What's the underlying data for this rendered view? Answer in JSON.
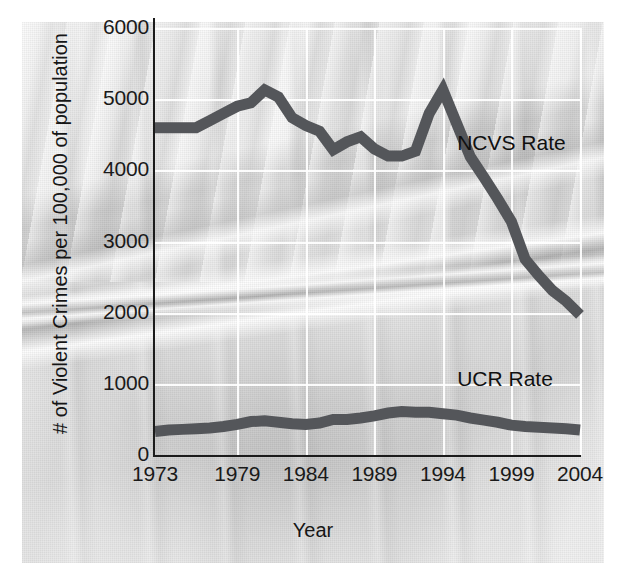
{
  "chart_data": {
    "type": "line",
    "title": "",
    "xlabel": "Year",
    "ylabel": "# of Violent Crimes per 100,000 of population",
    "xlim": [
      1973,
      2004
    ],
    "ylim": [
      0,
      6000
    ],
    "grid": true,
    "legend_position": "inline-right",
    "x_ticks": [
      "1973",
      "1979",
      "1984",
      "1989",
      "1994",
      "1999",
      "2004"
    ],
    "x_tick_values": [
      1973,
      1979,
      1984,
      1989,
      1994,
      1999,
      2004
    ],
    "y_ticks": [
      "0",
      "1000",
      "2000",
      "3000",
      "4000",
      "5000",
      "6000"
    ],
    "y_tick_values": [
      0,
      1000,
      2000,
      3000,
      4000,
      5000,
      6000
    ],
    "x": [
      1973,
      1974,
      1975,
      1976,
      1977,
      1978,
      1979,
      1980,
      1981,
      1982,
      1983,
      1984,
      1985,
      1986,
      1987,
      1988,
      1989,
      1990,
      1991,
      1992,
      1993,
      1994,
      1995,
      1996,
      1997,
      1998,
      1999,
      2000,
      2001,
      2002,
      2003,
      2004
    ],
    "series": [
      {
        "name": "NCVS Rate",
        "color": "#54565a",
        "values": [
          4600,
          4600,
          4600,
          4600,
          4700,
          4800,
          4900,
          4950,
          5130,
          5030,
          4740,
          4630,
          4550,
          4290,
          4400,
          4470,
          4300,
          4200,
          4200,
          4270,
          4800,
          5130,
          4660,
          4190,
          3900,
          3600,
          3280,
          2750,
          2520,
          2310,
          2160,
          1970
        ]
      },
      {
        "name": "UCR Rate",
        "color": "#54565a",
        "values": [
          330,
          350,
          360,
          370,
          380,
          400,
          430,
          470,
          480,
          460,
          440,
          430,
          450,
          500,
          500,
          520,
          550,
          590,
          610,
          600,
          600,
          580,
          560,
          520,
          490,
          460,
          420,
          400,
          390,
          380,
          370,
          350
        ]
      }
    ],
    "annotations": [
      {
        "text": "NCVS Rate",
        "x": 1996.5,
        "y": 4350
      },
      {
        "text": "UCR Rate",
        "x": 1996.5,
        "y": 1040
      }
    ]
  },
  "axis": {
    "y_label": "# of Violent Crimes per 100,000 of population",
    "x_label": "Year",
    "y_ticks": [
      "6000",
      "5000",
      "4000",
      "3000",
      "2000",
      "1000",
      "0"
    ],
    "x_ticks": [
      "1973",
      "1979",
      "1984",
      "1989",
      "1994",
      "1999",
      "2004"
    ]
  },
  "labels": {
    "ncvs": "NCVS Rate",
    "ucr": "UCR Rate"
  },
  "colors": {
    "line": "#54565a",
    "axis": "#1b1b1b",
    "grid": "#ffffff",
    "text": "#161616"
  }
}
